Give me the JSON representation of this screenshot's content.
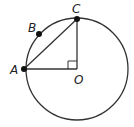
{
  "diagram": {
    "type": "circle-geometry",
    "circle": {
      "center": "O",
      "cx": 77,
      "cy": 69,
      "r": 51
    },
    "points": [
      {
        "name": "A",
        "label": "A",
        "x": 24,
        "y": 69,
        "dot": true
      },
      {
        "name": "B",
        "label": "B",
        "x": 39,
        "y": 34,
        "dot": true
      },
      {
        "name": "C",
        "label": "C",
        "x": 77,
        "y": 19,
        "dot": true
      },
      {
        "name": "O",
        "label": "O",
        "x": 77,
        "y": 69,
        "dot": false
      }
    ],
    "segments": [
      {
        "from": "A",
        "to": "C"
      },
      {
        "from": "A",
        "to": "O"
      },
      {
        "from": "O",
        "to": "C"
      }
    ],
    "right_angle_at": "O",
    "stroke_color": "#333333"
  }
}
